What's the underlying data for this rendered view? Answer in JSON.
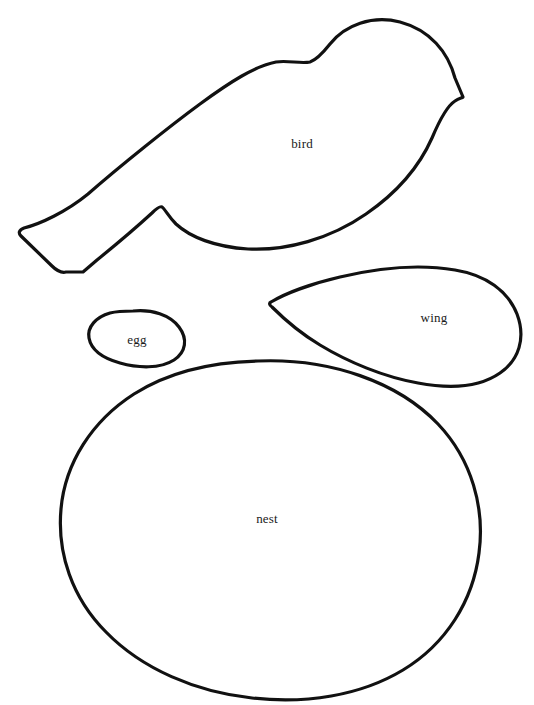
{
  "canvas": {
    "width": 534,
    "height": 705,
    "background_color": "#ffffff",
    "stroke_color": "#111111",
    "label_color": "#1a1a1a"
  },
  "document": {
    "type": "sewing-pattern-template",
    "description": "Black outline cut-out pattern pieces on white background"
  },
  "pieces": [
    {
      "id": "bird",
      "label": "bird",
      "label_x": 302,
      "label_y": 144,
      "bbox": [
        18,
        18,
        468,
        275
      ],
      "path": "M 463 97 L 455 78 C 448 52 430 30 400 22 C 372 15 345 25 330 44 C 322 54 316 60 310 62 C 300 64 288 60 276 62 C 255 66 230 82 200 104 C 170 126 120 166 88 194 C 66 212 40 224 24 228 C 19 230 18 233 21 236 L 52 266 C 57 271 62 273 66 272 L 83 272 L 97 260 C 118 243 140 224 152 213 C 157 208 160 206 162 207 C 165 209 168 216 176 224 C 190 237 215 247 248 249 C 286 251 330 239 366 214 C 398 192 420 165 432 138 C 440 119 447 106 455 101 C 459 98 462 98 463 97 Z"
    },
    {
      "id": "wing",
      "label": "wing",
      "label_x": 434,
      "label_y": 318,
      "bbox": [
        268,
        266,
        254,
        120
      ],
      "path": "M 271 302 C 284 294 310 284 340 277 C 378 268 420 264 455 270 C 486 275 508 291 517 314 C 526 338 519 360 500 373 C 480 387 450 389 418 383 C 384 377 348 362 320 345 C 300 333 283 318 272 307 C 269 305 269 303 271 302 Z"
    },
    {
      "id": "egg",
      "label": "egg",
      "label_x": 137,
      "label_y": 340,
      "bbox": [
        87,
        309,
        98,
        58
      ],
      "path": "M 133 311 C 152 309 170 315 179 327 C 188 339 186 352 174 360 C 160 369 138 368 120 363 C 102 358 91 349 89 338 C 87 327 96 317 110 313 C 118 311 126 311 133 311 Z"
    },
    {
      "id": "nest",
      "label": "nest",
      "label_x": 267,
      "label_y": 519,
      "bbox": [
        58,
        358,
        425,
        341
      ],
      "path": "M 258 361 C 330 358 398 382 438 424 C 472 460 485 508 479 553 C 473 601 446 644 403 670 C 360 696 305 704 252 698 C 196 692 142 669 106 632 C 72 598 57 553 61 509 C 65 463 92 421 134 394 C 170 371 213 362 258 361 Z"
    }
  ]
}
